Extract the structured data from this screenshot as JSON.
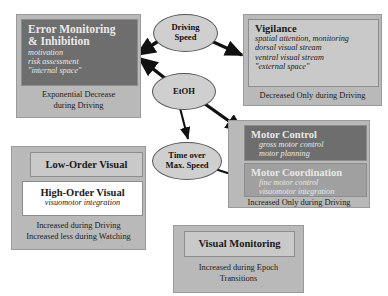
{
  "diagram": {
    "nodes": {
      "error_monitoring": {
        "title": "Error Monitoring\n& Inhibition",
        "title_line1": "Error Monitoring",
        "title_line2": "& Inhibition",
        "sub": [
          "motivation",
          "risk assessment",
          "\"internal space\""
        ],
        "caption_line1": "Exponential Decrease",
        "caption_line2": "during Driving",
        "box_fill": "#6e6e6e",
        "outer_fill": "#b9b9b9"
      },
      "vigilance": {
        "title": "Vigilance",
        "sub": [
          "spatial attention, monitoring",
          "dorsal visual stream",
          "ventral visual stream",
          "\"external space\""
        ],
        "caption_line1": "Decreased Only during Driving",
        "box_fill": "#c9c9c9",
        "outer_fill": "#b9b9b9"
      },
      "motor_control": {
        "title": "Motor Control",
        "sub": [
          "gross motor control",
          "motor planning"
        ],
        "box_fill": "#6e6e6e"
      },
      "motor_coordination": {
        "title": "Motor Coordination",
        "sub": [
          "fine motor control",
          "visuomotor integration"
        ],
        "box_fill": "#a0a0a0"
      },
      "motor_group": {
        "caption_line1": "Increased Only during Driving",
        "outer_fill": "#b9b9b9"
      },
      "low_order_visual": {
        "title": "Low-Order Visual",
        "box_fill": "#c9c9c9"
      },
      "high_order_visual": {
        "title": "High-Order Visual",
        "sub": [
          "visuomotor integration"
        ],
        "box_fill": "#ffffff"
      },
      "visual_group": {
        "caption_line1": "Increased during Driving",
        "caption_line2": "Increased less during Watching",
        "outer_fill": "#b9b9b9"
      },
      "visual_monitoring": {
        "title": "Visual Monitoring",
        "caption_line1": "Increased during Epoch",
        "caption_line2": "Transitions",
        "box_fill": "#c9c9c9",
        "outer_fill": "#b9b9b9"
      }
    },
    "ellipses": {
      "driving_speed": {
        "line1": "Driving",
        "line2": "Speed",
        "fill": "#cfcfcf"
      },
      "etoh": {
        "line1": "EtOH",
        "line2": "",
        "fill": "#cfcfcf"
      },
      "time_over_max_speed": {
        "line1": "Time over",
        "line2": "Max. Speed",
        "fill": "#cfcfcf"
      }
    },
    "arrows": [
      {
        "from": "driving_speed",
        "to": "error_monitoring"
      },
      {
        "from": "driving_speed",
        "to": "vigilance"
      },
      {
        "from": "etoh",
        "to": "error_monitoring"
      },
      {
        "from": "etoh",
        "to": "motor_control"
      },
      {
        "from": "etoh",
        "to": "time_over_max_speed"
      },
      {
        "from": "time_over_max_speed",
        "to": "motor_coordination"
      }
    ],
    "arrow_color": "#111111"
  }
}
